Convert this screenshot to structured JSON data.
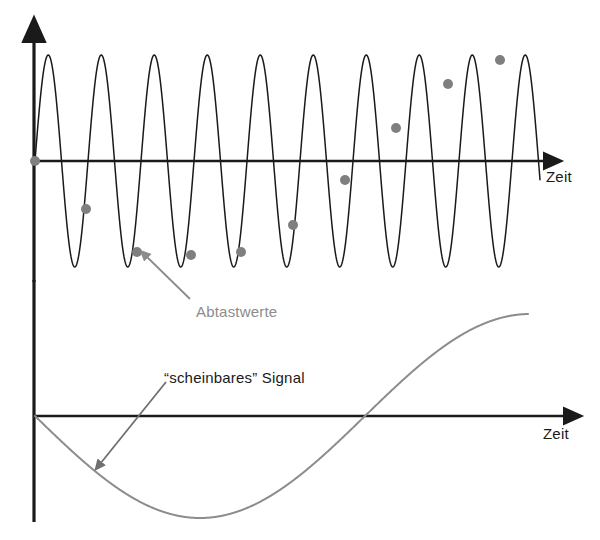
{
  "figure": {
    "background_color": "#ffffff",
    "width": 600,
    "height": 540
  },
  "colors": {
    "axis": "#1a1a1a",
    "carrier_signal": "#1a1a1a",
    "samples": "#7f7f7f",
    "apparent_signal": "#8c8c8c",
    "annotation_arrow_gray": "#8c8c8c",
    "annotation_text_gray": "#8c8c8c",
    "annotation_text_dark": "#1a1a1a"
  },
  "upper_plot": {
    "axis_label_x": "Zeit",
    "origin": {
      "x": 35,
      "y": 161
    },
    "x_axis": {
      "start_x": 34,
      "end_x": 552,
      "y": 161,
      "arrow": true
    },
    "y_axis": {
      "x": 34,
      "top_y": 33,
      "bottom_y": 280,
      "arrow": true
    }
  },
  "lower_plot": {
    "axis_label_x": "Zeit",
    "origin": {
      "x": 35,
      "y": 416
    },
    "x_axis": {
      "start_x": 34,
      "end_x": 572,
      "y": 416,
      "arrow": true
    },
    "y_axis": {
      "x": 34,
      "top_y": 280,
      "bottom_y": 522,
      "arrow": false
    }
  },
  "annotations": [
    {
      "id": "abtastwerte",
      "text": "Abtastwerte",
      "color": "#8c8c8c",
      "text_x": 196,
      "text_y": 303,
      "arrow_from": {
        "x": 190,
        "y": 299
      },
      "arrow_to": {
        "x": 146,
        "y": 256
      }
    },
    {
      "id": "scheinbares-signal",
      "text": "“scheinbares” Signal",
      "color": "#1a1a1a",
      "text_x": 164,
      "text_y": 369,
      "arrow_from": {
        "x": 166,
        "y": 382
      },
      "arrow_to": {
        "x": 100,
        "y": 464
      }
    }
  ],
  "chart_data": {
    "type": "line",
    "title": "",
    "xlabel": "Zeit",
    "ylabel": "",
    "grid": false,
    "legend_position": "inline-annotations",
    "panels": [
      {
        "name": "upper",
        "description": "Hochfrequentes Originalsignal mit Abtastwerten (Unterabtastung / Aliasing)",
        "xlim": [
          0,
          10.1
        ],
        "ylim": [
          -1.1,
          1.1
        ],
        "axis_label_x": "Zeit",
        "series": [
          {
            "name": "Originalsignal",
            "type": "line",
            "color": "#1a1a1a",
            "form": "sine",
            "amplitude": 1.0,
            "cycles": 10,
            "period_px": 53,
            "phase": 0,
            "x_start_px": 35,
            "x_end_px": 540,
            "baseline_y_px": 161,
            "amplitude_px": 106
          },
          {
            "name": "Abtastwerte",
            "type": "scatter",
            "color": "#7f7f7f",
            "marker": "circle",
            "marker_radius_px": 5,
            "points_px": [
              {
                "x": 35,
                "y": 161
              },
              {
                "x": 86,
                "y": 209
              },
              {
                "x": 137,
                "y": 252
              },
              {
                "x": 191,
                "y": 255
              },
              {
                "x": 241,
                "y": 252
              },
              {
                "x": 293,
                "y": 225
              },
              {
                "x": 345,
                "y": 180
              },
              {
                "x": 396,
                "y": 128
              },
              {
                "x": 448,
                "y": 84
              },
              {
                "x": 500,
                "y": 60
              }
            ],
            "values_normalized": [
              0.0,
              -0.45,
              -0.86,
              -0.89,
              -0.86,
              -0.6,
              -0.18,
              0.31,
              0.73,
              0.95
            ]
          }
        ]
      },
      {
        "name": "lower",
        "description": "Aus den Abtastwerten rekonstruiertes, niederfrequentes “scheinbares” Signal",
        "xlim": [
          0,
          10.1
        ],
        "ylim": [
          -1.1,
          1.1
        ],
        "axis_label_x": "Zeit",
        "series": [
          {
            "name": "“scheinbares” Signal",
            "type": "line",
            "color": "#8c8c8c",
            "form": "sine",
            "amplitude": 1.0,
            "cycles": 0.78,
            "phase": 180,
            "x_start_px": 35,
            "x_end_px": 528,
            "baseline_y_px": 416,
            "amplitude_px": 102,
            "minimum_px": {
              "x": 190,
              "y": 518
            },
            "zero_crossing_px": {
              "x": 365,
              "y": 416
            },
            "end_px": {
              "x": 528,
              "y": 315
            }
          }
        ]
      }
    ]
  }
}
